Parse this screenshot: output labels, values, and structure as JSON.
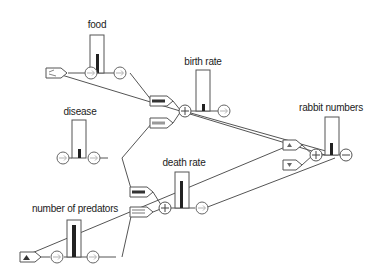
{
  "diagram": {
    "title": "",
    "colors": {
      "stroke": "#555555",
      "bar": "#222222",
      "background": "#ffffff",
      "switch_fill": "#888888"
    },
    "nodes": [
      {
        "id": "food",
        "label": "food",
        "type": "gauge",
        "level": 0.45
      },
      {
        "id": "disease",
        "label": "disease",
        "type": "gauge",
        "level": 0.3
      },
      {
        "id": "birth_rate",
        "label": "birth rate",
        "type": "gauge",
        "level": 0.15
      },
      {
        "id": "death_rate",
        "label": "death rate",
        "type": "gauge",
        "level": 0.75
      },
      {
        "id": "number_of_predators",
        "label": "number of predators",
        "type": "gauge",
        "level": 0.85
      },
      {
        "id": "rabbit_numbers",
        "label": "rabbit numbers",
        "type": "gauge",
        "level": 0.3
      }
    ],
    "operators": [
      {
        "id": "sum_birth",
        "symbol": "+"
      },
      {
        "id": "sum_death",
        "symbol": "+"
      },
      {
        "id": "sum_rabbit",
        "symbol": "+"
      },
      {
        "id": "out_rabbit",
        "symbol": "−"
      }
    ],
    "switches": [
      {
        "id": "food_source",
        "glyph": "≈"
      },
      {
        "id": "predator_source",
        "glyph": "▲"
      },
      {
        "id": "rabbit_up",
        "glyph": "▲"
      },
      {
        "id": "rabbit_down",
        "glyph": "▼"
      }
    ]
  }
}
